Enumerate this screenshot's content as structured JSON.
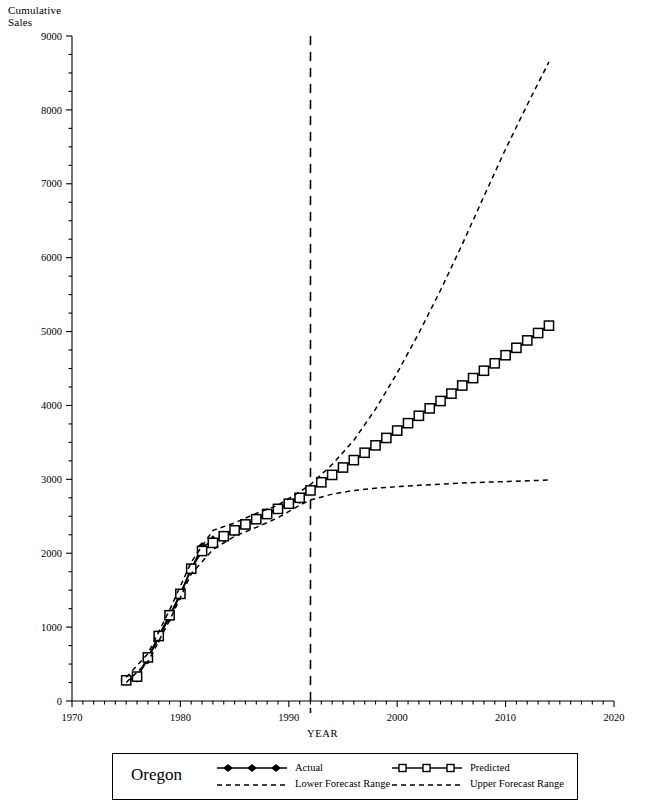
{
  "chart_data": {
    "type": "line",
    "title": "",
    "xlabel": "YEAR",
    "ylabel": "Cumulative Sales",
    "ylabel_line1": "Cumulative",
    "ylabel_line2": "Sales",
    "xlim": [
      1970,
      2020
    ],
    "ylim": [
      0,
      9000
    ],
    "xticks": [
      1970,
      1980,
      1990,
      2000,
      2010,
      2020
    ],
    "xticklabels": [
      "1970",
      "1980",
      "1990",
      "2000",
      "2010",
      "2020"
    ],
    "xminor_step": 1,
    "yticks": [
      0,
      1000,
      2000,
      3000,
      4000,
      5000,
      6000,
      7000,
      8000,
      9000
    ],
    "yticklabels": [
      "0",
      "1000",
      "2000",
      "3000",
      "4000",
      "5000",
      "6000",
      "7000",
      "8000",
      "9000"
    ],
    "yminor_step": 250,
    "grid": false,
    "legend_position": "bottom",
    "forecast_start_year": 1992,
    "annotations": [
      {
        "type": "vline",
        "x": 1992,
        "style": "dashed",
        "label": "forecast-start-divider"
      }
    ],
    "series": [
      {
        "name": "Actual",
        "marker": "filled-diamond",
        "linestyle": "solid",
        "x": [
          1975,
          1976,
          1977,
          1978,
          1979,
          1980,
          1981,
          1982,
          1983,
          1984,
          1985,
          1986,
          1987,
          1988,
          1989,
          1990,
          1991,
          1992
        ],
        "values": [
          280,
          320,
          570,
          860,
          1140,
          1440,
          1790,
          2080,
          2170,
          2230,
          2300,
          2390,
          2470,
          2540,
          2600,
          2670,
          2740,
          2850
        ]
      },
      {
        "name": "Predicted",
        "marker": "open-square",
        "linestyle": "solid",
        "x": [
          1975,
          1976,
          1977,
          1978,
          1979,
          1980,
          1981,
          1982,
          1983,
          1984,
          1985,
          1986,
          1987,
          1988,
          1989,
          1990,
          1991,
          1992,
          1993,
          1994,
          1995,
          1996,
          1997,
          1998,
          1999,
          2000,
          2001,
          2002,
          2003,
          2004,
          2005,
          2006,
          2007,
          2008,
          2009,
          2010,
          2011,
          2012,
          2013,
          2014
        ],
        "values": [
          280,
          330,
          590,
          880,
          1160,
          1450,
          1790,
          2030,
          2140,
          2230,
          2310,
          2390,
          2460,
          2530,
          2600,
          2670,
          2750,
          2850,
          2960,
          3060,
          3160,
          3260,
          3360,
          3460,
          3560,
          3660,
          3760,
          3860,
          3960,
          4060,
          4160,
          4270,
          4370,
          4470,
          4570,
          4680,
          4780,
          4880,
          4980,
          5080
        ]
      },
      {
        "name": "Lower Forecast Range",
        "marker": "none",
        "linestyle": "dashed",
        "x": [
          1975,
          1977,
          1979,
          1981,
          1983,
          1985,
          1987,
          1989,
          1991,
          1992,
          1994,
          1996,
          1998,
          2000,
          2002,
          2004,
          2006,
          2008,
          2010,
          2012,
          2014
        ],
        "values": [
          250,
          530,
          1090,
          1720,
          2050,
          2230,
          2350,
          2480,
          2650,
          2720,
          2800,
          2850,
          2880,
          2900,
          2920,
          2935,
          2950,
          2960,
          2970,
          2980,
          2990
        ]
      },
      {
        "name": "Upper Forecast Range",
        "marker": "none",
        "linestyle": "dashed",
        "x": [
          1975,
          1977,
          1979,
          1981,
          1983,
          1985,
          1987,
          1989,
          1991,
          1992,
          1994,
          1996,
          1998,
          2000,
          2002,
          2004,
          2006,
          2008,
          2010,
          2012,
          2014
        ],
        "values": [
          320,
          640,
          1230,
          1880,
          2310,
          2410,
          2540,
          2650,
          2830,
          2930,
          3200,
          3530,
          3950,
          4440,
          4980,
          5560,
          6180,
          6830,
          7470,
          8070,
          8650
        ]
      }
    ]
  },
  "legend": {
    "region_label": "Oregon",
    "entries": [
      {
        "key": "actual",
        "label": "Actual"
      },
      {
        "key": "predicted",
        "label": "Predicted"
      },
      {
        "key": "lower",
        "label": "Lower Forecast Range"
      },
      {
        "key": "upper",
        "label": "Upper Forecast Range"
      }
    ]
  },
  "colors": {
    "ink": "#000000",
    "background": "#ffffff"
  }
}
